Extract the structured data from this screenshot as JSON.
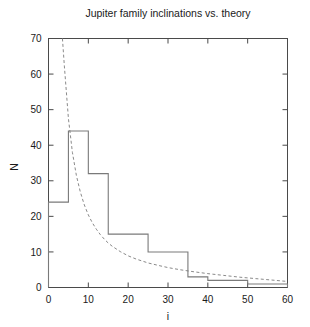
{
  "chart_data": {
    "type": "bar",
    "title": "Jupiter family inclinations vs. theory",
    "xlabel": "i",
    "ylabel": "N",
    "xlim": [
      0,
      60
    ],
    "ylim": [
      0,
      70
    ],
    "xticks": [
      0,
      10,
      20,
      30,
      40,
      50,
      60
    ],
    "yticks": [
      0,
      10,
      20,
      30,
      40,
      50,
      60,
      70
    ],
    "grid": false,
    "legend": "none",
    "bin_width": 5,
    "bin_edges": [
      0,
      5,
      10,
      15,
      20,
      25,
      30,
      35,
      40,
      45,
      50,
      55,
      60
    ],
    "categories": [
      "0-5",
      "5-10",
      "10-15",
      "15-20",
      "20-25",
      "25-30",
      "30-35",
      "35-40",
      "40-45",
      "45-50",
      "50-55",
      "55-60"
    ],
    "values": [
      24,
      44,
      32,
      15,
      15,
      10,
      10,
      3,
      2,
      2,
      1,
      1
    ],
    "series": [
      {
        "name": "Jupiter family inclinations",
        "style": "step-histogram",
        "color": "#7a7a7a",
        "values": [
          24,
          44,
          32,
          15,
          15,
          10,
          10,
          3,
          2,
          2,
          1,
          1
        ]
      },
      {
        "name": "theory",
        "style": "dashed-curve",
        "color": "#8a8a8a",
        "x": [
          3.5,
          4,
          5,
          6,
          7,
          8,
          9,
          10,
          11,
          12,
          13,
          14,
          15,
          16,
          18,
          20,
          22,
          25,
          28,
          30,
          33,
          36,
          40,
          44,
          48,
          52,
          56,
          60
        ],
        "y": [
          70,
          62,
          47.5,
          38,
          31.5,
          26.8,
          23.2,
          20.4,
          18.2,
          16.4,
          14.9,
          13.6,
          12.5,
          11.6,
          10.1,
          8.9,
          8,
          6.9,
          6.1,
          5.6,
          5,
          4.5,
          3.9,
          3.4,
          2.9,
          2.5,
          2.1,
          1.7
        ]
      }
    ],
    "axis": {
      "title": "Jupiter family inclinations vs. theory",
      "y_axis_label": "N",
      "x_axis_label": "i"
    }
  },
  "colors": {
    "background": "#ffffff",
    "frame": "#4a4a4a",
    "histogram": "#7a7a7a",
    "theory_curve": "#8a8a8a",
    "text": "#1a1a1a"
  }
}
